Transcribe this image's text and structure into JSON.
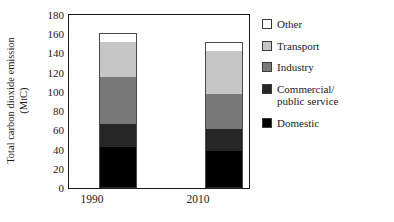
{
  "chart_data": {
    "type": "bar",
    "stacked": true,
    "title": "",
    "xlabel": "",
    "ylabel": "Total carbon dioxide emission (MtC)",
    "ylabel_line1": "Total carbon dioxide emission",
    "ylabel_line2": "(MtC)",
    "categories": [
      "1990",
      "2010"
    ],
    "ylim": [
      0,
      180
    ],
    "ytick_step": 20,
    "yticks": [
      0,
      20,
      40,
      60,
      80,
      100,
      120,
      140,
      160,
      180
    ],
    "ytick_labels": [
      "0",
      "20",
      "40",
      "60",
      "80",
      "100",
      "120",
      "140",
      "160",
      "180"
    ],
    "grid": false,
    "legend_position": "right",
    "series": [
      {
        "name": "Domestic",
        "values": [
          43,
          39
        ],
        "color": "#000000"
      },
      {
        "name": "Commercial/\npublic service",
        "values": [
          24,
          22
        ],
        "color": "#262626"
      },
      {
        "name": "Industry",
        "values": [
          49,
          37
        ],
        "color": "#787878"
      },
      {
        "name": "Transport",
        "values": [
          36,
          45
        ],
        "color": "#c6c6c6"
      },
      {
        "name": "Other",
        "values": [
          9,
          9
        ],
        "color": "#ffffff"
      }
    ],
    "totals": [
      161,
      152
    ],
    "stack_order_bottom_to_top": [
      "Domestic",
      "Commercial/public service",
      "Industry",
      "Transport",
      "Other"
    ],
    "legend_entries": [
      {
        "label": "Other",
        "color": "#ffffff"
      },
      {
        "label": "Transport",
        "color": "#c6c6c6"
      },
      {
        "label": "Industry",
        "color": "#787878"
      },
      {
        "label": "Commercial/\npublic service",
        "color": "#262626"
      },
      {
        "label": "Domestic",
        "color": "#000000"
      }
    ]
  }
}
